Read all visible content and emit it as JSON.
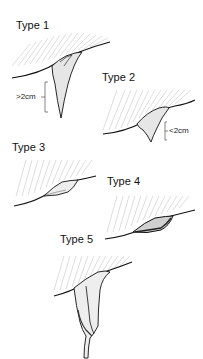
{
  "diagram": {
    "background": "#ffffff",
    "ink_color": "#111111",
    "panels": [
      {
        "id": "type-1",
        "label": "Type 1",
        "measurement": ">2cm",
        "description": "long pointed single projection, longer than 2 cm"
      },
      {
        "id": "type-2",
        "label": "Type 2",
        "measurement": "<2cm",
        "description": "short pointed single projection, shorter than 2 cm"
      },
      {
        "id": "type-3",
        "label": "Type 3",
        "measurement": "",
        "description": "flat rounded fold along the edge"
      },
      {
        "id": "type-4",
        "label": "Type 4",
        "measurement": "",
        "description": "thicker shaded fold along the edge"
      },
      {
        "id": "type-5",
        "label": "Type 5",
        "measurement": "",
        "description": "long bifid band-like projection"
      }
    ]
  }
}
